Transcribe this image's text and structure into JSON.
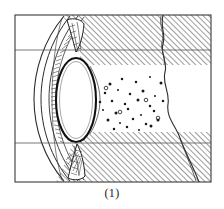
{
  "figure": {
    "caption": "(1)",
    "kind": "anatomical-line-drawing",
    "frame": {
      "x": 15,
      "y": 15,
      "width": 196,
      "height": 167,
      "stroke": "#3a3a3a",
      "stroke_width": 1,
      "fill": "#ffffff"
    },
    "colors": {
      "ink": "#1a1a1a",
      "line": "#2b2b2b",
      "hatch": "#262626",
      "frame": "#3a3a3a",
      "background": "#ffffff",
      "band_line": "#555555"
    },
    "band_lines": [
      {
        "name": "upper-band-rule",
        "y": 50
      },
      {
        "name": "lower-band-rule",
        "y": 143
      }
    ],
    "hatch_bands": [
      {
        "name": "upper-hatched-band",
        "y_top": 16,
        "y_bottom": 65
      },
      {
        "name": "lower-hatched-band",
        "y_top": 132,
        "y_bottom": 181
      }
    ],
    "hatch": {
      "angle_deg": 45,
      "spacing_px": 4,
      "stroke_width": 0.9
    },
    "lens": {
      "cx": 76,
      "cy": 100,
      "rx": 20,
      "ry": 42,
      "stroke_width": 2.0,
      "shape": "biconvex"
    },
    "vitreous_dots": [
      [
        110,
        84
      ],
      [
        122,
        79
      ],
      [
        136,
        82
      ],
      [
        150,
        77
      ],
      [
        161,
        83
      ],
      [
        105,
        93
      ],
      [
        118,
        90
      ],
      [
        130,
        94
      ],
      [
        143,
        91
      ],
      [
        155,
        96
      ],
      [
        112,
        101
      ],
      [
        125,
        104
      ],
      [
        138,
        100
      ],
      [
        150,
        106
      ],
      [
        163,
        101
      ],
      [
        103,
        110
      ],
      [
        116,
        113
      ],
      [
        128,
        109
      ],
      [
        141,
        115
      ],
      [
        154,
        111
      ],
      [
        108,
        120
      ],
      [
        120,
        123
      ],
      [
        133,
        119
      ],
      [
        146,
        124
      ],
      [
        158,
        120
      ],
      [
        114,
        129
      ],
      [
        127,
        127
      ],
      [
        139,
        130
      ],
      [
        151,
        126
      ],
      [
        100,
        102
      ]
    ],
    "open_dots": [
      [
        120,
        112
      ],
      [
        146,
        100
      ],
      [
        158,
        118
      ],
      [
        106,
        88
      ]
    ],
    "sclera_waves": [
      {
        "name": "posterior-sclera-boundary",
        "x_top": 163,
        "x_bottom": 199
      },
      {
        "name": "hatch-inner-divider",
        "x_top": 161,
        "x_bottom": 169
      }
    ]
  }
}
